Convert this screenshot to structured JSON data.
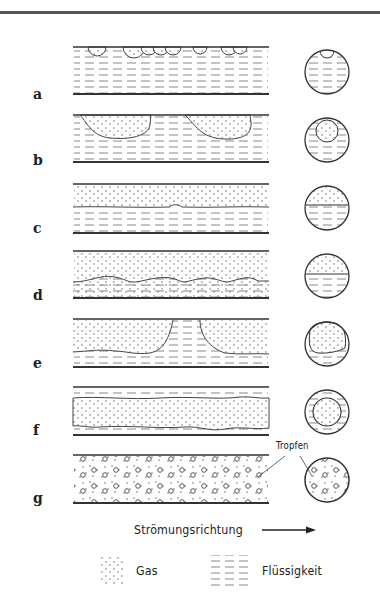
{
  "figure": {
    "rows": [
      {
        "label": "a",
        "pattern": "bubble flow"
      },
      {
        "label": "b",
        "pattern": "plug flow"
      },
      {
        "label": "c",
        "pattern": "stratified flow"
      },
      {
        "label": "d",
        "pattern": "wavy flow"
      },
      {
        "label": "e",
        "pattern": "slug flow"
      },
      {
        "label": "f",
        "pattern": "annular flow"
      },
      {
        "label": "g",
        "pattern": "mist / droplet flow"
      }
    ],
    "annotation": "Tropfen",
    "flow_direction_label": "Strömungsrichtung",
    "legend": [
      {
        "key": "gas",
        "label": "Gas",
        "pattern": "dots"
      },
      {
        "key": "liquid",
        "label": "Flüssigkeit",
        "pattern": "dashes"
      }
    ]
  },
  "colors": {
    "ink": "#222222",
    "rule": "#555555",
    "background": "#ffffff"
  }
}
